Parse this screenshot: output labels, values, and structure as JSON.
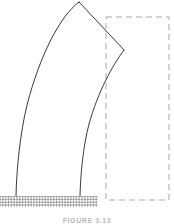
{
  "figure": {
    "caption": "FIGURE 3.13",
    "colors": {
      "outline": "#3a3a3a",
      "dashed_reference": "#a9a9a9",
      "hatch": "#8f8f8f",
      "background": "#ffffff",
      "caption_text": "#b9b9b9"
    },
    "parts": {
      "deformed_member_label": "Deformed member",
      "left_fiber_label": "Left extreme fiber",
      "right_fiber_label": "Right extreme fiber",
      "apex_label": "Apex",
      "notch_label": "Re-entrant notch vertex",
      "reference_outline_label": "Undeformed reference outline",
      "foundation_label": "Fixed hatched base"
    },
    "geometry": {
      "canvas_width": 174,
      "canvas_height": 224,
      "apex_point": [
        79,
        2
      ],
      "notch_vertex": [
        124,
        50
      ],
      "left_base_point": [
        16,
        197
      ],
      "right_base_point": [
        80,
        197
      ],
      "dashed_rect": {
        "x": 106,
        "y": 17,
        "width": 63,
        "height": 183
      },
      "hatched_base": {
        "x": 0,
        "y": 196,
        "width": 98,
        "height": 11
      }
    }
  }
}
